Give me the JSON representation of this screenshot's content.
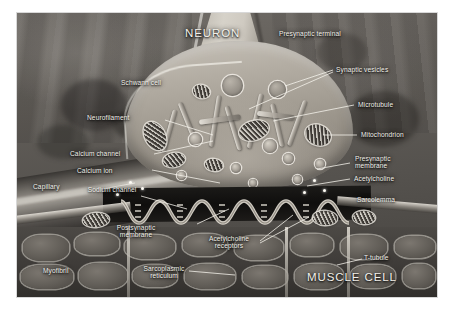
{
  "figure": {
    "kind": "neuromuscular-junction-micrograph-diagram",
    "headings": [
      {
        "id": "neuron",
        "text": "NEURON"
      },
      {
        "id": "muscle_cell",
        "text": "MUSCLE CELL"
      }
    ],
    "labels": [
      {
        "id": "presynaptic_terminal",
        "text": "Presynaptic terminal"
      },
      {
        "id": "synaptic_vesicles",
        "text": "Synaptic vesicles"
      },
      {
        "id": "microtubule",
        "text": "Microtubule"
      },
      {
        "id": "mitochondrion",
        "text": "Mitochondrion"
      },
      {
        "id": "presynaptic_membrane",
        "text": "Presynaptic membrane"
      },
      {
        "id": "acetylcholine",
        "text": "Acetylcholine"
      },
      {
        "id": "sarcolemma",
        "text": "Sarcolemma"
      },
      {
        "id": "t_tubule",
        "text": "T-tubule"
      },
      {
        "id": "schwann_cell",
        "text": "Schwann cell"
      },
      {
        "id": "neurofilament",
        "text": "Neurofilament"
      },
      {
        "id": "calcium_channel",
        "text": "Calcium channel"
      },
      {
        "id": "calcium_ion",
        "text": "Calcium ion"
      },
      {
        "id": "capillary",
        "text": "Capillary"
      },
      {
        "id": "sodium_channel",
        "text": "Sodium channel"
      },
      {
        "id": "postsynaptic_membrane",
        "text": "Postsynaptic membrane"
      },
      {
        "id": "acetylcholine_receptors",
        "text": "Acetylcholine receptors"
      },
      {
        "id": "myofibril",
        "text": "Myofibril"
      },
      {
        "id": "sarcoplasmic_reticulum",
        "text": "Sarcoplasmic reticulum"
      }
    ],
    "colors": {
      "page_background": "#ffffff",
      "plate_dark": "#46433f",
      "plate_mid": "#6e6a65",
      "terminal_light": "#c8c3ba",
      "cleft_dark": "#0f0e0d",
      "label_text": "#f2f0ea",
      "leader_line": "#f5f3ec"
    }
  }
}
